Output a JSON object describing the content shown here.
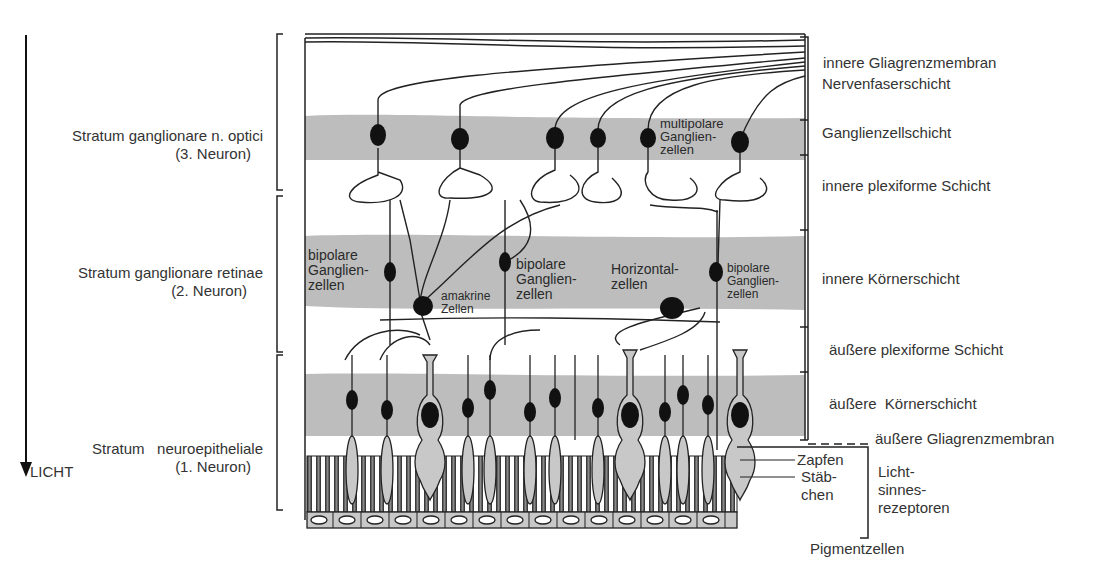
{
  "diagram": {
    "light_direction_label": "LICHT",
    "left_labels": [
      {
        "line1": "Stratum ganglionare n. optici",
        "line2": "(3. Neuron)"
      },
      {
        "line1": "Stratum ganglionare retinae",
        "line2": "(2. Neuron)"
      },
      {
        "line1": "Stratum   neuroepitheliale",
        "line2": "(1. Neuron)"
      }
    ],
    "right_labels": [
      "innere Gliagrenzmembran",
      "Nervenfaserschicht",
      "Ganglienzellschicht",
      "innere plexiforme Schicht",
      "innere Körnerschicht",
      "äußere plexiforme Schicht",
      "äußere  Körnerschicht",
      "äußere Gliagrenzmembran",
      "Pigmentzellen"
    ],
    "receptor_labels": {
      "zapfen": "Zapfen",
      "staebchen_1": "Stäb-",
      "staebchen_2": "chen",
      "group_1": "Licht-",
      "group_2": "sinnes-",
      "group_3": "rezeptoren"
    },
    "cell_labels": {
      "multipolar": [
        "multipolare",
        "Ganglien-",
        "zellen"
      ],
      "bipolar_left": [
        "bipolare",
        "Ganglien-",
        "zellen"
      ],
      "amakrin": [
        "amakrine",
        "Zellen"
      ],
      "bipolar_mid": [
        "bipolare",
        "Ganglien-",
        "zellen"
      ],
      "horizontal": [
        "Horizontal-",
        "zellen"
      ],
      "bipolar_right": [
        "bipolare",
        "Ganglien-",
        "zellen"
      ]
    },
    "colors": {
      "band_gray": "#bdbdbd",
      "cell_fill": "#c8c8c8",
      "nucleus": "#111111",
      "line": "#1a1a1a"
    }
  }
}
